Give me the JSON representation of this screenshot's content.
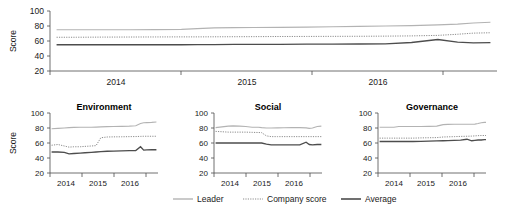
{
  "chart_data": [
    {
      "id": "overall",
      "type": "line",
      "title": "",
      "xlabel": "",
      "ylabel": "Score",
      "ylim": [
        20,
        100
      ],
      "yticks": [
        20,
        40,
        60,
        80,
        100
      ],
      "xlim": [
        2013.5,
        2016.9
      ],
      "xticks": [
        2013.5,
        2014.5,
        2015.5,
        2016.9
      ],
      "xtick_labels": [
        "2014",
        "2015",
        "2016"
      ],
      "grid": false,
      "legend": "bottom",
      "x": [
        2013.55,
        2013.7,
        2013.9,
        2014.1,
        2014.3,
        2014.5,
        2014.62,
        2014.75,
        2014.9,
        2015.05,
        2015.25,
        2015.45,
        2015.65,
        2015.85,
        2016.05,
        2016.25,
        2016.45,
        2016.6,
        2016.72,
        2016.85
      ],
      "series": [
        {
          "name": "Leader",
          "values": [
            75,
            75,
            75,
            75,
            75.2,
            75.5,
            76.5,
            77.5,
            77.8,
            78,
            78.2,
            78.5,
            79,
            79.5,
            80,
            80.5,
            81.5,
            82.5,
            84,
            85
          ]
        },
        {
          "name": "Company score",
          "values": [
            65,
            65,
            65.2,
            65.3,
            65.4,
            65.5,
            65.5,
            65.6,
            65.7,
            65.8,
            66,
            66.1,
            66.2,
            66.3,
            66.5,
            66.8,
            67.5,
            69,
            70.5,
            71
          ]
        },
        {
          "name": "Average",
          "values": [
            55,
            55,
            55,
            55,
            55,
            55,
            55.2,
            55.3,
            55.4,
            55.5,
            55.6,
            55.7,
            55.8,
            56,
            56.2,
            58,
            62,
            58.5,
            57.5,
            57.8
          ]
        }
      ]
    },
    {
      "id": "environment",
      "type": "line",
      "title": "Environment",
      "xlabel": "",
      "ylabel": "Score",
      "ylim": [
        20,
        100
      ],
      "yticks": [
        20,
        40,
        60,
        80,
        100
      ],
      "xlim": [
        2013.5,
        2016.9
      ],
      "xticks": [
        2013.5,
        2014.5,
        2015.5,
        2016.9
      ],
      "xtick_labels": [
        "2014",
        "2015",
        "2016"
      ],
      "grid": false,
      "x": [
        2013.55,
        2013.75,
        2013.95,
        2014.1,
        2014.25,
        2014.45,
        2014.6,
        2014.8,
        2014.95,
        2015.1,
        2015.3,
        2015.5,
        2015.75,
        2016.0,
        2016.2,
        2016.35,
        2016.45,
        2016.55,
        2016.7,
        2016.85
      ],
      "series": [
        {
          "name": "Leader",
          "values": [
            79,
            79.5,
            80,
            80.5,
            80.8,
            81,
            81,
            81,
            81.2,
            81.5,
            81.8,
            82,
            82.2,
            82.5,
            83,
            86,
            87,
            87.2,
            87.5,
            88
          ]
        },
        {
          "name": "Company score",
          "values": [
            57,
            58,
            56,
            54.5,
            55,
            55,
            55.5,
            56,
            56.5,
            67,
            68,
            68.2,
            68.3,
            68.5,
            68.6,
            68.8,
            69,
            69,
            69,
            69
          ]
        },
        {
          "name": "Average",
          "values": [
            48,
            48,
            47.5,
            45.5,
            46,
            46.5,
            47,
            47.5,
            48,
            48.5,
            49,
            49.2,
            49.5,
            49.8,
            50,
            55,
            50.5,
            50.8,
            51,
            51
          ]
        }
      ]
    },
    {
      "id": "social",
      "type": "line",
      "title": "Social",
      "xlabel": "",
      "ylabel": "",
      "ylim": [
        20,
        100
      ],
      "yticks": [
        20,
        40,
        60,
        80,
        100
      ],
      "xlim": [
        2013.5,
        2016.9
      ],
      "xticks": [
        2013.5,
        2014.5,
        2015.5,
        2016.9
      ],
      "xtick_labels": [
        "2014",
        "2015",
        "2016"
      ],
      "grid": false,
      "x": [
        2013.55,
        2013.75,
        2013.95,
        2014.1,
        2014.3,
        2014.5,
        2014.7,
        2014.9,
        2015.0,
        2015.15,
        2015.3,
        2015.5,
        2015.7,
        2015.95,
        2016.2,
        2016.4,
        2016.5,
        2016.6,
        2016.75,
        2016.88
      ],
      "series": [
        {
          "name": "Leader",
          "values": [
            80.5,
            81.5,
            82.5,
            82.8,
            82.5,
            82,
            81,
            81,
            80.5,
            80,
            80,
            80.2,
            80.3,
            80.5,
            80.5,
            80.2,
            79.5,
            80,
            82,
            82.5
          ]
        },
        {
          "name": "Company score",
          "values": [
            75.5,
            75,
            74.5,
            74.5,
            74.5,
            74.5,
            74.2,
            74,
            73.8,
            69.5,
            68.5,
            68.5,
            68.5,
            68.5,
            68.5,
            68.5,
            68.5,
            68.5,
            68.5,
            68.5
          ]
        },
        {
          "name": "Average",
          "values": [
            60,
            60,
            60,
            60,
            60,
            60,
            60,
            60,
            60,
            58.5,
            57.5,
            57.5,
            57.5,
            57.5,
            57.5,
            61,
            58,
            57.5,
            58,
            58
          ]
        }
      ]
    },
    {
      "id": "governance",
      "type": "line",
      "title": "Governance",
      "xlabel": "",
      "ylabel": "",
      "ylim": [
        20,
        100
      ],
      "yticks": [
        20,
        40,
        60,
        80,
        100
      ],
      "xlim": [
        2013.5,
        2016.9
      ],
      "xticks": [
        2013.5,
        2014.5,
        2015.5,
        2016.9
      ],
      "xtick_labels": [
        "2014",
        "2015",
        "2016"
      ],
      "grid": false,
      "x": [
        2013.55,
        2013.8,
        2014.0,
        2014.15,
        2014.35,
        2014.6,
        2014.85,
        2015.1,
        2015.35,
        2015.55,
        2015.7,
        2015.9,
        2016.1,
        2016.3,
        2016.45,
        2016.55,
        2016.65,
        2016.75,
        2016.85,
        2016.9
      ],
      "series": [
        {
          "name": "Leader",
          "values": [
            81,
            81,
            81,
            82,
            82,
            82,
            82,
            82.2,
            82.5,
            84.5,
            84.8,
            85,
            85,
            85,
            85,
            85.2,
            86,
            87,
            87.5,
            87.5
          ]
        },
        {
          "name": "Company score",
          "values": [
            66.5,
            66.5,
            66.5,
            66.5,
            66.5,
            66.5,
            66.8,
            67,
            67.2,
            68,
            68.2,
            68.5,
            68.8,
            69,
            69.2,
            69.5,
            69.8,
            70,
            70,
            70
          ]
        },
        {
          "name": "Average",
          "values": [
            62,
            62,
            62,
            62,
            62,
            62,
            62.2,
            62.5,
            62.8,
            63,
            63.2,
            63.5,
            63.8,
            65,
            63,
            63.5,
            64,
            64,
            64.5,
            64.5
          ]
        }
      ]
    }
  ],
  "axis": {
    "ylabel": "Score",
    "yticks": [
      "100",
      "80",
      "60",
      "40",
      "20"
    ],
    "xtick_labels": [
      "2014",
      "2015",
      "2016"
    ]
  },
  "panels": {
    "environment_title": "Environment",
    "social_title": "Social",
    "governance_title": "Governance"
  },
  "legend": {
    "items": [
      {
        "label": "Leader",
        "style": "solid",
        "color": "#b3b3b3"
      },
      {
        "label": "Company score",
        "style": "dotted",
        "color": "#8c8c8c"
      },
      {
        "label": "Average",
        "style": "solid",
        "color": "#4d4d4d"
      }
    ]
  }
}
